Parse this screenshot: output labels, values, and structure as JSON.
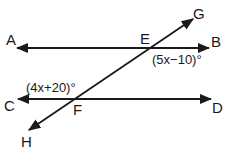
{
  "diagram": {
    "type": "parallel-lines-transversal",
    "stroke_color": "#1a1a1a",
    "points": {
      "A": {
        "label": "A"
      },
      "B": {
        "label": "B"
      },
      "C": {
        "label": "C"
      },
      "D": {
        "label": "D"
      },
      "E": {
        "label": "E"
      },
      "F": {
        "label": "F"
      },
      "G": {
        "label": "G"
      },
      "H": {
        "label": "H"
      }
    },
    "lines": [
      {
        "name": "line-AB",
        "from": "A",
        "to": "B",
        "arrows": "both"
      },
      {
        "name": "line-CD",
        "from": "C",
        "to": "D",
        "arrows": "both"
      },
      {
        "name": "transversal-GH",
        "from": "H",
        "to": "G",
        "arrows": "both",
        "through": [
          "F",
          "E"
        ]
      }
    ],
    "angles": [
      {
        "vertex": "E",
        "label": "(5x−10)°",
        "position": "below-right"
      },
      {
        "vertex": "F",
        "label": "(4x+20)°",
        "position": "above-left"
      }
    ]
  }
}
